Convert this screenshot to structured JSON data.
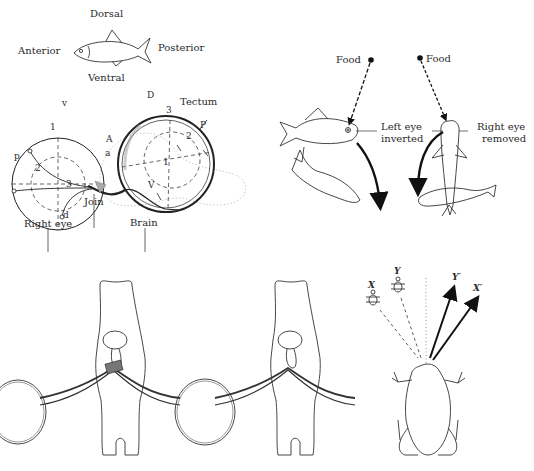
{
  "figure": {
    "panel_a": {
      "orientation": {
        "dorsal": "Dorsal",
        "anterior": "Anterior",
        "posterior": "Posterior",
        "ventral": "Ventral"
      },
      "eye_labels": {
        "v": "v",
        "p": "p",
        "d": "d",
        "a": "a",
        "n1": "1",
        "n2": "2",
        "n3": "3"
      },
      "tectum_labels": {
        "D": "D",
        "P": "P",
        "V": "V",
        "A": "A",
        "n1": "1",
        "n2": "2",
        "n3": "3"
      },
      "callouts": {
        "tectum": "Tectum",
        "join": "Join",
        "right_eye": "Right eye",
        "brain": "Brain"
      }
    },
    "panel_b": {
      "left": {
        "food": "Food",
        "label_line1": "Left eye",
        "label_line2": "inverted"
      },
      "right": {
        "food": "Food",
        "label_line1": "Right eye",
        "label_line2": "removed"
      }
    },
    "panel_c": {
      "frog": {
        "x": "X",
        "y": "Y",
        "y_prime": "Y′",
        "x_prime": "X′"
      }
    }
  }
}
